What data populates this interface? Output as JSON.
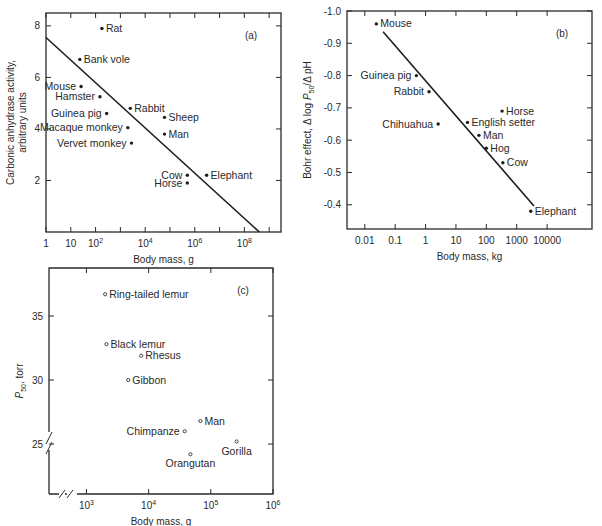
{
  "chart_data": [
    {
      "id": "a",
      "type": "scatter",
      "panel_label": "(a)",
      "title": "",
      "xlabel": "Body mass, g",
      "ylabel_lines": [
        "Carbonic anhydrase activity,",
        "arbitrary units"
      ],
      "xscale": "log",
      "xlim": [
        1,
        3000000000.0
      ],
      "ylim": [
        0,
        8.5
      ],
      "xticks": [
        {
          "value": 1,
          "label": "1"
        },
        {
          "value": 10,
          "label": "10"
        },
        {
          "value": 100,
          "label": "10",
          "sup": "2"
        },
        {
          "value": 10000,
          "label": "10",
          "sup": "4"
        },
        {
          "value": 1000000,
          "label": "10",
          "sup": "6"
        },
        {
          "value": 100000000,
          "label": "10",
          "sup": "8"
        }
      ],
      "xminor": [
        1000,
        100000,
        10000000,
        1000000000
      ],
      "yticks": [
        2,
        4,
        6,
        8
      ],
      "fit_line": [
        [
          1,
          7.55
        ],
        [
          400000000.0,
          0
        ]
      ],
      "points": [
        {
          "label": "Rat",
          "x": 180,
          "y": 7.9,
          "side": "right"
        },
        {
          "label": "Bank vole",
          "x": 23,
          "y": 6.7,
          "side": "right"
        },
        {
          "label": "Mouse",
          "x": 26,
          "y": 5.65,
          "side": "left"
        },
        {
          "label": "Hamster",
          "x": 150,
          "y": 5.25,
          "side": "left"
        },
        {
          "label": "Guinea pig",
          "x": 280,
          "y": 4.6,
          "side": "left"
        },
        {
          "label": "Macaque monkey",
          "x": 2000,
          "y": 4.05,
          "side": "left"
        },
        {
          "label": "Vervet monkey",
          "x": 2800,
          "y": 3.45,
          "side": "left"
        },
        {
          "label": "Rabbit",
          "x": 2500,
          "y": 4.8,
          "side": "right"
        },
        {
          "label": "Sheep",
          "x": 60000,
          "y": 4.45,
          "side": "right"
        },
        {
          "label": "Man",
          "x": 60000,
          "y": 3.8,
          "side": "right"
        },
        {
          "label": "Cow",
          "x": 500000,
          "y": 2.2,
          "side": "left"
        },
        {
          "label": "Horse",
          "x": 500000,
          "y": 1.9,
          "side": "left"
        },
        {
          "label": "Elephant",
          "x": 3000000,
          "y": 2.2,
          "side": "right"
        }
      ]
    },
    {
      "id": "b",
      "type": "scatter",
      "panel_label": "(b)",
      "title": "",
      "xlabel": "Body mass, kg",
      "ylabel": "Bohr effect, Δ log P50/Δ pH",
      "xscale": "log",
      "xlim": [
        0.0026,
        300000
      ],
      "ylim": [
        -1.0,
        -0.325
      ],
      "yaxis_inverted_display": true,
      "xticks": [
        {
          "value": 0.01,
          "label": "0.01"
        },
        {
          "value": 0.1,
          "label": "0.1"
        },
        {
          "value": 1,
          "label": "1"
        },
        {
          "value": 10,
          "label": "10"
        },
        {
          "value": 100,
          "label": "100"
        },
        {
          "value": 1000,
          "label": "1000"
        },
        {
          "value": 10000,
          "label": "10000"
        }
      ],
      "yticks": [
        {
          "value": -1.0,
          "label": "-1.0"
        },
        {
          "value": -0.9,
          "label": "-0.9"
        },
        {
          "value": -0.8,
          "label": "-0.8"
        },
        {
          "value": -0.7,
          "label": "-0.7"
        },
        {
          "value": -0.6,
          "label": "-0.6"
        },
        {
          "value": -0.5,
          "label": "-0.5"
        },
        {
          "value": -0.4,
          "label": "-0.4"
        }
      ],
      "fit_line": [
        [
          0.04,
          -0.936
        ],
        [
          3700,
          -0.396
        ]
      ],
      "points": [
        {
          "label": "Mouse",
          "x": 0.024,
          "y": -0.96,
          "side": "right"
        },
        {
          "label": "Guinea pig",
          "x": 0.5,
          "y": -0.8,
          "side": "left"
        },
        {
          "label": "Rabbit",
          "x": 1.3,
          "y": -0.75,
          "side": "left"
        },
        {
          "label": "Chihuahua",
          "x": 2.6,
          "y": -0.65,
          "side": "left"
        },
        {
          "label": "English setter",
          "x": 24,
          "y": -0.655,
          "side": "right"
        },
        {
          "label": "Horse",
          "x": 330,
          "y": -0.69,
          "side": "right"
        },
        {
          "label": "Man",
          "x": 57,
          "y": -0.615,
          "side": "right"
        },
        {
          "label": "Hog",
          "x": 100,
          "y": -0.575,
          "side": "right"
        },
        {
          "label": "Cow",
          "x": 350,
          "y": -0.53,
          "side": "right"
        },
        {
          "label": "Elephant",
          "x": 2900,
          "y": -0.38,
          "side": "right"
        }
      ]
    },
    {
      "id": "c",
      "type": "scatter",
      "panel_label": "(c)",
      "title": "",
      "xlabel": "Body mass, g",
      "ylabel": "P50, torr",
      "xscale": "log",
      "xlim": [
        250,
        1000000
      ],
      "ylim": [
        21.1,
        38.75
      ],
      "axis_breaks": true,
      "xticks": [
        {
          "value": 1000,
          "label": "10",
          "sup": "3"
        },
        {
          "value": 10000,
          "label": "10",
          "sup": "4"
        },
        {
          "value": 100000,
          "label": "10",
          "sup": "5"
        },
        {
          "value": 1000000,
          "label": "10",
          "sup": "6"
        }
      ],
      "yticks": [
        25,
        30,
        35
      ],
      "points": [
        {
          "label": "Ring-tailed lemur",
          "x": 2000,
          "y": 36.7,
          "side": "right"
        },
        {
          "label": "Black lemur",
          "x": 2100,
          "y": 32.8,
          "side": "right"
        },
        {
          "label": "Rhesus",
          "x": 7600,
          "y": 31.9,
          "side": "right"
        },
        {
          "label": "Gibbon",
          "x": 4700,
          "y": 30.0,
          "side": "right"
        },
        {
          "label": "Man",
          "x": 68000,
          "y": 26.8,
          "side": "right"
        },
        {
          "label": "Chimpanze",
          "x": 38000,
          "y": 26.0,
          "side": "left"
        },
        {
          "label": "Gorilla",
          "x": 260000,
          "y": 25.2,
          "side": "below"
        },
        {
          "label": "Orangutan",
          "x": 47000,
          "y": 24.2,
          "side": "below"
        }
      ]
    }
  ]
}
